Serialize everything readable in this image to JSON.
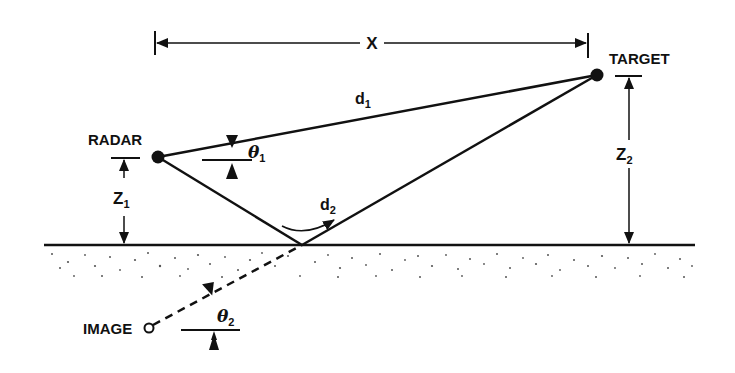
{
  "diagram": {
    "labels": {
      "radar": "RADAR",
      "target": "TARGET",
      "image": "IMAGE",
      "x": "X",
      "d1_base": "d",
      "d1_sub": "1",
      "d2_base": "d",
      "d2_sub": "2",
      "z1_base": "Z",
      "z1_sub": "1",
      "z2_base": "Z",
      "z2_sub": "2",
      "theta1_base": "θ",
      "theta1_sub": "1",
      "theta2_base": "θ",
      "theta2_sub": "2"
    },
    "nodes": [
      {
        "id": "radar",
        "label": "RADAR",
        "x": 158,
        "y": 157,
        "style": "filled-dot"
      },
      {
        "id": "target",
        "label": "TARGET",
        "x": 597,
        "y": 75,
        "style": "filled-dot"
      },
      {
        "id": "reflection",
        "label": "",
        "x": 302,
        "y": 245,
        "style": "point"
      },
      {
        "id": "image",
        "label": "IMAGE",
        "x": 148,
        "y": 328,
        "style": "open-circle"
      }
    ],
    "edges": [
      {
        "from": "radar",
        "to": "target",
        "label": "d1",
        "style": "solid",
        "meaning": "direct path"
      },
      {
        "from": "radar",
        "to": "reflection",
        "label": "d2",
        "style": "solid",
        "meaning": "reflected path (incident)"
      },
      {
        "from": "reflection",
        "to": "target",
        "label": "d2",
        "style": "solid",
        "meaning": "reflected path (outgoing)"
      },
      {
        "from": "image",
        "to": "reflection",
        "label": "",
        "style": "dashed",
        "meaning": "image path"
      }
    ],
    "dimensions": [
      {
        "label": "X",
        "orientation": "horizontal",
        "meaning": "horizontal range radar to target"
      },
      {
        "label": "Z1",
        "orientation": "vertical",
        "meaning": "radar height above ground"
      },
      {
        "label": "Z2",
        "orientation": "vertical",
        "meaning": "target height above ground"
      }
    ],
    "angles": [
      {
        "label": "θ1",
        "meaning": "elevation angle of direct path"
      },
      {
        "label": "θ2",
        "meaning": "depression angle of image path"
      }
    ],
    "ground": {
      "style": "stippled surface"
    }
  }
}
